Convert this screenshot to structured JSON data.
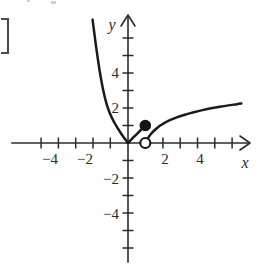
{
  "chart_data": {
    "type": "line",
    "title": "",
    "xlabel": "x",
    "ylabel": "y",
    "xlim": [
      -5.8,
      7.4
    ],
    "ylim": [
      -6.2,
      7.4
    ],
    "grid": false,
    "legend_position": "none",
    "x_ticks": [
      -5,
      -4,
      -3,
      -2,
      -1,
      1,
      2,
      3,
      4,
      5,
      6
    ],
    "y_ticks": [
      -5,
      -4,
      -3,
      -2,
      -1,
      1,
      2,
      3,
      4,
      5,
      6
    ],
    "x_tick_labels": [
      {
        "value": -4,
        "label": "−4"
      },
      {
        "value": -2,
        "label": "−2"
      },
      {
        "value": 2,
        "label": "2"
      },
      {
        "value": 4,
        "label": "4"
      }
    ],
    "y_tick_labels": [
      {
        "value": 4,
        "label": "4"
      },
      {
        "value": 2,
        "label": "2"
      },
      {
        "value": -2,
        "label": "−2"
      },
      {
        "value": -4,
        "label": "−4"
      }
    ],
    "series": [
      {
        "name": "left-branch",
        "description": "steep decreasing curve on negative x, approaching origin",
        "points": [
          [
            -2.05,
            7.05
          ],
          [
            -1.95,
            6.3
          ],
          [
            -1.85,
            5.55
          ],
          [
            -1.75,
            4.85
          ],
          [
            -1.65,
            4.2
          ],
          [
            -1.55,
            3.62
          ],
          [
            -1.45,
            3.1
          ],
          [
            -1.35,
            2.66
          ],
          [
            -1.25,
            2.28
          ],
          [
            -1.15,
            1.96
          ],
          [
            -1.05,
            1.7
          ],
          [
            -0.95,
            1.48
          ],
          [
            -0.85,
            1.28
          ],
          [
            -0.75,
            1.1
          ],
          [
            -0.65,
            0.93
          ],
          [
            -0.55,
            0.77
          ],
          [
            -0.45,
            0.62
          ],
          [
            -0.35,
            0.47
          ],
          [
            -0.25,
            0.33
          ],
          [
            -0.15,
            0.2
          ],
          [
            -0.05,
            0.06
          ],
          [
            0.0,
            0.0
          ]
        ]
      },
      {
        "name": "middle-segment",
        "description": "short rising segment from origin to the solid dot",
        "points": [
          [
            0.0,
            0.0
          ],
          [
            0.35,
            0.36
          ],
          [
            0.7,
            0.7
          ],
          [
            1.0,
            1.0
          ]
        ]
      },
      {
        "name": "right-branch",
        "description": "increasing concave-down curve starting at the open circle",
        "points": [
          [
            1.05,
            0.06
          ],
          [
            1.15,
            0.26
          ],
          [
            1.3,
            0.48
          ],
          [
            1.5,
            0.7
          ],
          [
            1.75,
            0.92
          ],
          [
            2.0,
            1.08
          ],
          [
            2.3,
            1.25
          ],
          [
            2.6,
            1.38
          ],
          [
            3.0,
            1.53
          ],
          [
            3.4,
            1.65
          ],
          [
            3.8,
            1.76
          ],
          [
            4.3,
            1.88
          ],
          [
            4.8,
            1.98
          ],
          [
            5.3,
            2.07
          ],
          [
            5.8,
            2.15
          ],
          [
            6.3,
            2.22
          ],
          [
            6.55,
            2.26
          ]
        ]
      }
    ],
    "markers": [
      {
        "name": "closed-point",
        "type": "filled",
        "x": 1.0,
        "y": 1.0,
        "radius": 5.2
      },
      {
        "name": "open-point",
        "type": "open",
        "x": 1.0,
        "y": 0.0,
        "radius": 5.0
      }
    ],
    "annotations": {
      "left_bracket": "]"
    },
    "colors": {
      "curve": "#1a1a1a",
      "axis": "#2b2b2b",
      "background": "#fefefe",
      "marker_fill": "#141414",
      "marker_open_fill": "#ffffff"
    }
  }
}
